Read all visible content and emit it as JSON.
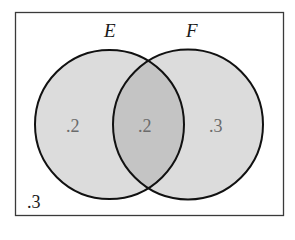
{
  "diagram": {
    "type": "venn",
    "sets": [
      {
        "name": "E",
        "label": "E"
      },
      {
        "name": "F",
        "label": "F"
      }
    ],
    "regions": {
      "e_only": ".2",
      "e_and_f": ".2",
      "f_only": ".3",
      "neither": ".3"
    },
    "colors": {
      "border": "#3a3a3a",
      "circle_stroke": "#111111",
      "circle_fill": "#dcdcdc",
      "intersection_fill": "#c4c4c4",
      "background": "#ffffff"
    }
  }
}
